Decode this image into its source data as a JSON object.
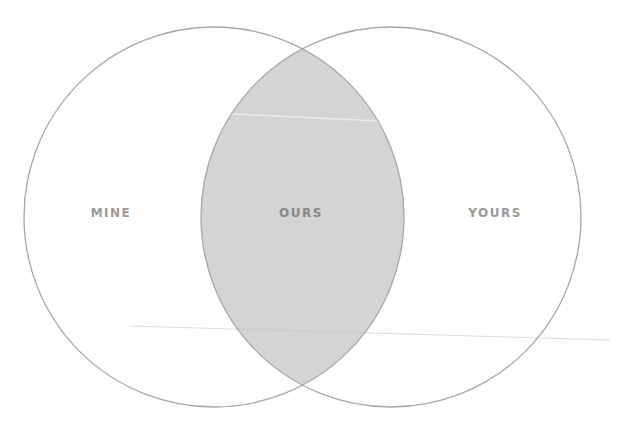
{
  "diagram": {
    "type": "venn",
    "sets": [
      {
        "id": "left",
        "label": "MINE",
        "cx": 214,
        "cy": 217,
        "r": 190
      },
      {
        "id": "right",
        "label": "YOURS",
        "cx": 391,
        "cy": 217,
        "r": 190
      }
    ],
    "intersection": {
      "label": "OURS"
    },
    "colors": {
      "stroke": "#a8a8a8",
      "intersection_fill": "#d4d4d4",
      "label": "#9a9a9a",
      "background": "#ffffff"
    }
  },
  "labels": {
    "mine": "MINE",
    "ours": "OURS",
    "yours": "YOURS"
  }
}
